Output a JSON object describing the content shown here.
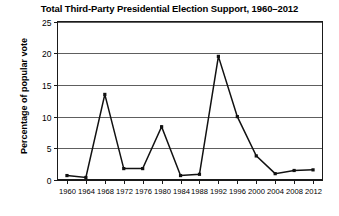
{
  "chart_data": {
    "type": "line",
    "title": "Total Third-Party Presidential Election Support, 1960–2012",
    "xlabel": "",
    "ylabel": "Percentage of popular vote",
    "categories": [
      "1960",
      "1964",
      "1968",
      "1972",
      "1976",
      "1980",
      "1984",
      "1988",
      "1992",
      "1996",
      "2000",
      "2004",
      "2008",
      "2012"
    ],
    "x": [
      1960,
      1964,
      1968,
      1972,
      1976,
      1980,
      1984,
      1988,
      1992,
      1996,
      2000,
      2004,
      2008,
      2012
    ],
    "values": [
      0.7,
      0.4,
      13.5,
      1.8,
      1.8,
      8.4,
      0.7,
      0.9,
      19.5,
      10.0,
      3.8,
      1.0,
      1.5,
      1.6
    ],
    "series": [
      {
        "name": "Third-party share of popular vote",
        "values": [
          0.7,
          0.4,
          13.5,
          1.8,
          1.8,
          8.4,
          0.7,
          0.9,
          19.5,
          10.0,
          3.8,
          1.0,
          1.5,
          1.6
        ]
      }
    ],
    "ylim": [
      0,
      25
    ],
    "yticks": [
      0,
      5,
      10,
      15,
      20,
      25
    ],
    "ytick_labels": [
      "0",
      "5",
      "10",
      "15",
      "20",
      "25"
    ],
    "xlim": [
      1958,
      2014
    ],
    "grid": "horizontal",
    "legend": "none",
    "line_color": "#111111",
    "marker": "square"
  }
}
